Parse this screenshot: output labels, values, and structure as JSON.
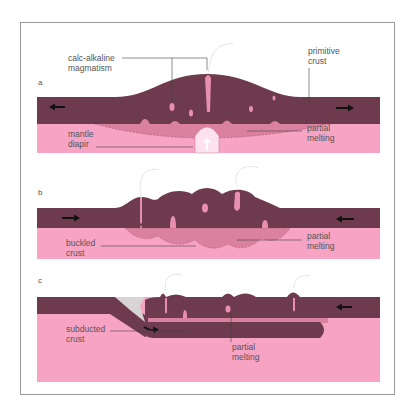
{
  "figure": {
    "colors": {
      "crust": "#6e3b4e",
      "mantle": "#f7a3c3",
      "partial_melt": "#d9819f",
      "diapir": "#fde2ee",
      "wedge": "#d8d3d5",
      "leader": "#444444",
      "arrow": "#111111"
    },
    "panels": [
      {
        "id": "a",
        "letter": "a",
        "labels": {
          "calc_alkaline_1": "calc-alkaline",
          "calc_alkaline_2": "magmatism",
          "primitive_1": "primitive",
          "primitive_2": "crust",
          "partial_1": "partial",
          "partial_2": "melting",
          "mantle_1": "mantle",
          "mantle_2": "diapir"
        },
        "arrows": [
          "left",
          "right"
        ]
      },
      {
        "id": "b",
        "letter": "b",
        "labels": {
          "buckled_1": "buckled",
          "buckled_2": "crust",
          "partial_1": "partial",
          "partial_2": "melting"
        },
        "arrows": [
          "right",
          "left"
        ]
      },
      {
        "id": "c",
        "letter": "c",
        "labels": {
          "subducted_1": "subducted",
          "subducted_2": "crust",
          "partial_1": "partial",
          "partial_2": "melting"
        },
        "arrows": [
          "left"
        ]
      }
    ]
  }
}
